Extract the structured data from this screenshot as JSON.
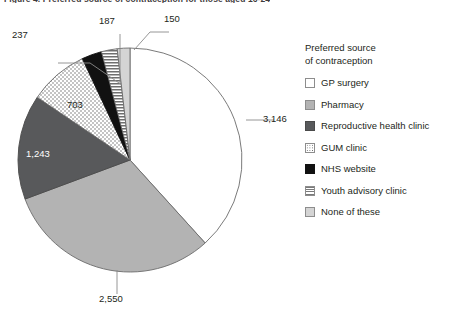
{
  "figure": {
    "title": "Figure 4. Preferred source of contraception for those aged 16-24"
  },
  "legend": {
    "title": "Preferred source\nof contraception",
    "items": [
      {
        "label": "GP surgery",
        "pattern": "solid-white",
        "color": "#ffffff"
      },
      {
        "label": "Pharmacy",
        "pattern": "solid-lightgrey",
        "color": "#b3b3b3"
      },
      {
        "label": "Reproductive health clinic",
        "pattern": "solid-darkgrey",
        "color": "#58595b"
      },
      {
        "label": "GUM clinic",
        "pattern": "dotted",
        "color": "#ffffff"
      },
      {
        "label": "NHS website",
        "pattern": "solid-black",
        "color": "#111111"
      },
      {
        "label": "Youth advisory clinic",
        "pattern": "horizontal-stripes",
        "color": "#9a9a9a"
      },
      {
        "label": "None of these",
        "pattern": "solid-palegrey",
        "color": "#d4d4d4"
      }
    ]
  },
  "chart_data": {
    "type": "pie",
    "title": "Preferred source of contraception",
    "categories": [
      "GP surgery",
      "Pharmacy",
      "Reproductive health clinic",
      "GUM clinic",
      "NHS website",
      "Youth advisory clinic",
      "None of these"
    ],
    "values": [
      3146,
      2550,
      1243,
      703,
      237,
      187,
      150
    ],
    "labels": [
      "3,146",
      "2,550",
      "1,243",
      "703",
      "237",
      "187",
      "150"
    ],
    "total": 8216,
    "start_angle_deg": 0,
    "direction": "clockwise",
    "legend_position": "right",
    "grid": false
  }
}
